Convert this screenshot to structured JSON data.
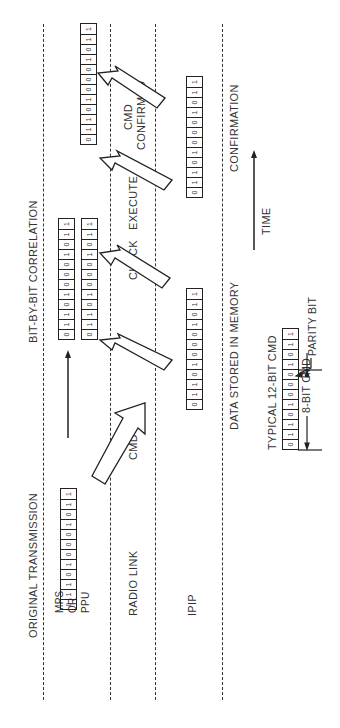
{
  "diagram": {
    "headers": {
      "original_transmission": "ORIGINAL TRANSMISSION",
      "bit_correlation": "BIT-BY-BIT CORRELATION"
    },
    "rows": {
      "mps_line1": "MPS",
      "mps_line2": "OR",
      "mps_line3": "PPU",
      "radio_link": "RADIO LINK",
      "ipip": "IPIP"
    },
    "steps": {
      "cmd": "CMD",
      "check": "CHECK",
      "execute": "EXECUTE",
      "cmd_confirmed_line1": "CMD",
      "cmd_confirmed_line2": "CONFIRMED"
    },
    "bottom": {
      "data_stored": "DATA STORED IN MEMORY",
      "confirmation": "CONFIRMATION",
      "time": "TIME",
      "typical": "TYPICAL 12-BIT CMD",
      "parity_bit": "PARITY BIT",
      "eight_bit": "8-BIT CMD"
    },
    "bits": [
      "0",
      "1",
      "1",
      "0",
      "1",
      "0",
      "0",
      "0",
      "1",
      "0",
      "1",
      "1"
    ]
  }
}
